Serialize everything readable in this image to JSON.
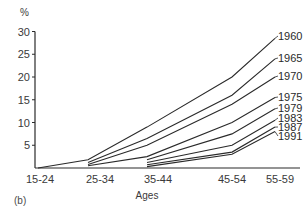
{
  "chart_data": {
    "type": "line",
    "title": "",
    "panel_label": "(b)",
    "xlabel": "Ages",
    "ylabel": "%",
    "categories": [
      "15-24",
      "25-34",
      "35-44",
      "45-54",
      "55-59"
    ],
    "yticks": [
      5,
      10,
      15,
      20,
      25,
      30
    ],
    "ylim": [
      0,
      30
    ],
    "grid": false,
    "legend_position": "inline-right",
    "series": [
      {
        "name": "1960",
        "values": [
          0,
          1.8,
          9.0,
          20.0,
          28.5
        ]
      },
      {
        "name": "1965",
        "values": [
          null,
          1.2,
          6.5,
          16.0,
          24.0
        ]
      },
      {
        "name": "1970",
        "values": [
          null,
          0.8,
          5.0,
          14.0,
          20.0
        ]
      },
      {
        "name": "1975",
        "values": [
          null,
          0.5,
          2.5,
          10.0,
          15.5
        ]
      },
      {
        "name": "1979",
        "values": [
          null,
          null,
          1.8,
          7.5,
          13.0
        ]
      },
      {
        "name": "1983",
        "values": [
          null,
          null,
          1.2,
          5.0,
          10.5
        ]
      },
      {
        "name": "1987",
        "values": [
          null,
          null,
          0.7,
          3.5,
          9.0
        ]
      },
      {
        "name": "1991",
        "values": [
          null,
          null,
          0.3,
          3.0,
          8.0
        ]
      }
    ]
  },
  "layout": {
    "x_positions": [
      38,
      88,
      147,
      232,
      275
    ],
    "label_x": [
      40,
      100,
      158,
      232,
      280
    ],
    "label_y": [
      40,
      62,
      80,
      101,
      112,
      122,
      131,
      140
    ],
    "y0": 168,
    "px_per_unit": 4.55,
    "line_color": "#2a2a2a"
  }
}
